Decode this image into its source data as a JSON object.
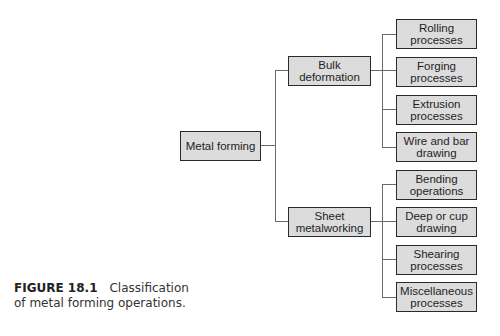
{
  "diagram": {
    "type": "tree",
    "root": {
      "label": "Metal forming"
    },
    "branches": [
      {
        "label_line1": "Bulk",
        "label_line2": "deformation",
        "children": [
          {
            "l1": "Rolling",
            "l2": "processes"
          },
          {
            "l1": "Forging",
            "l2": "processes"
          },
          {
            "l1": "Extrusion",
            "l2": "processes"
          },
          {
            "l1": "Wire and bar",
            "l2": "drawing"
          }
        ]
      },
      {
        "label_line1": "Sheet",
        "label_line2": "metalworking",
        "children": [
          {
            "l1": "Bending",
            "l2": "operations"
          },
          {
            "l1": "Deep or cup",
            "l2": "drawing"
          },
          {
            "l1": "Shearing",
            "l2": "processes"
          },
          {
            "l1": "Miscellaneous",
            "l2": "processes"
          }
        ]
      }
    ]
  },
  "caption": {
    "figure_label": "FIGURE 18.1",
    "text_line1": "Classification",
    "text_line2": "of metal forming operations."
  },
  "colors": {
    "box_fill": "#dcdcdc",
    "box_border": "#2a2a2a",
    "connector": "#6a6a6a"
  }
}
